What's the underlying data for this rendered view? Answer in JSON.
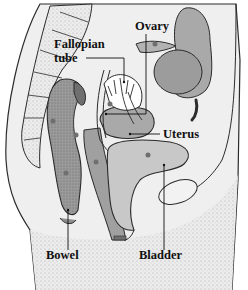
{
  "figure": {
    "palette": {
      "background": "#ffffff",
      "body": "#e9e9e9",
      "organ_dark": "#8e8e8e",
      "organ_mid": "#a9a9a9",
      "organ_light": "#c8c8c8",
      "outline": "#2b2b2b",
      "dot": "#6f6f6f",
      "label": "#111111"
    }
  },
  "labels": {
    "fallopian_tube_line1": "Fallopian",
    "fallopian_tube_line2": "tube",
    "ovary": "Ovary",
    "uterus": "Uterus",
    "bowel": "Bowel",
    "bladder": "Bladder"
  }
}
